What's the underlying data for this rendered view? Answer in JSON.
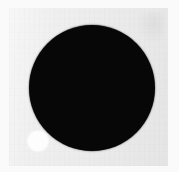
{
  "image": {
    "title": "Black disc with white dot",
    "description": "Scanned grayscale plate showing a large solid black circle with a small white circular dot near its lower-left edge.",
    "width": 179,
    "height": 172,
    "caption": ""
  },
  "colors": {
    "page_background": "#ffffff",
    "paper_margin": "#fafafa",
    "plate_background": "#ededed",
    "disc_fill": "#070707",
    "dot_fill": "#fdfdfd"
  },
  "plate": {
    "name": "scan-plate",
    "x": 9,
    "y": 8,
    "width": 159,
    "height": 158
  },
  "shapes": [
    {
      "name": "black-disc",
      "type": "circle",
      "fill": "#070707",
      "center_x": 92,
      "center_y": 88,
      "radius": 63
    },
    {
      "name": "white-dot",
      "type": "circle",
      "fill": "#fdfdfd",
      "center_x": 38,
      "center_y": 141,
      "radius": 10
    }
  ],
  "annotations": {
    "smudge_label": "",
    "texture_label": ""
  }
}
